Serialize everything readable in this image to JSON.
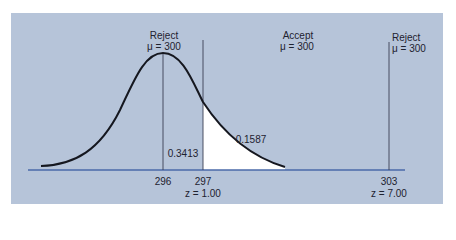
{
  "colors": {
    "panel": "#b6c4d9",
    "axis": "#4a6aa8",
    "curve": "#15171f",
    "shade": "#ffffff"
  },
  "labels": {
    "left_region": {
      "title": "Reject",
      "mu": "μ = 300"
    },
    "middle_region": {
      "title": "Accept",
      "mu": "μ = 300"
    },
    "right_region": {
      "title": "Reject",
      "mu": "μ = 300"
    },
    "area_center": "0.3413",
    "area_tail": "0.1587",
    "tick_296": "296",
    "tick_297": "297",
    "z_297": "z = 1.00",
    "tick_303": "303",
    "z_303": "z = 7.00"
  }
}
